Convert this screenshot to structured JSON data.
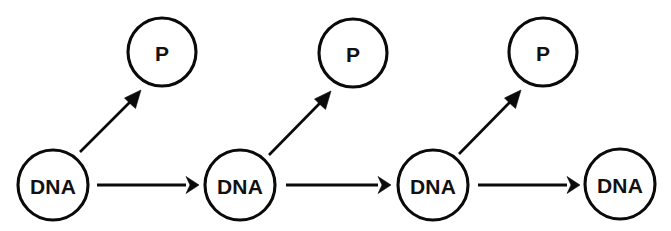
{
  "diagram": {
    "canvas": {
      "width": 671,
      "height": 231,
      "background": "#ffffff"
    },
    "stroke_color": "#0a0a0a",
    "fill_color": "#ffffff",
    "nodes": [
      {
        "id": "dna-1",
        "label": "DNA",
        "kind": "dna",
        "cx": 53,
        "cy": 185,
        "r": 35
      },
      {
        "id": "dna-2",
        "label": "DNA",
        "kind": "dna",
        "cx": 240,
        "cy": 185,
        "r": 35
      },
      {
        "id": "dna-3",
        "label": "DNA",
        "kind": "dna",
        "cx": 433,
        "cy": 185,
        "r": 35
      },
      {
        "id": "dna-4",
        "label": "DNA",
        "kind": "dna",
        "cx": 620,
        "cy": 184,
        "r": 35
      },
      {
        "id": "p-1",
        "label": "P",
        "kind": "protein",
        "cx": 162,
        "cy": 52,
        "r": 34
      },
      {
        "id": "p-2",
        "label": "P",
        "kind": "protein",
        "cx": 353,
        "cy": 53,
        "r": 34
      },
      {
        "id": "p-3",
        "label": "P",
        "kind": "protein",
        "cx": 543,
        "cy": 52,
        "r": 34
      }
    ],
    "edges": [
      {
        "id": "edge-dna1-dna2",
        "from": "dna-1",
        "to": "dna-2",
        "kind": "horizontal",
        "x1": 97,
        "y1": 185,
        "x2": 197,
        "y2": 185
      },
      {
        "id": "edge-dna2-dna3",
        "from": "dna-2",
        "to": "dna-3",
        "kind": "horizontal",
        "x1": 286,
        "y1": 185,
        "x2": 389,
        "y2": 185
      },
      {
        "id": "edge-dna3-dna4",
        "from": "dna-3",
        "to": "dna-4",
        "kind": "horizontal",
        "x1": 478,
        "y1": 185,
        "x2": 578,
        "y2": 185
      },
      {
        "id": "edge-dna1-p1",
        "from": "dna-1",
        "to": "p-1",
        "kind": "diagonal",
        "x1": 80,
        "y1": 152,
        "x2": 139,
        "y2": 93
      },
      {
        "id": "edge-dna2-p2",
        "from": "dna-2",
        "to": "p-2",
        "kind": "diagonal",
        "x1": 269,
        "y1": 155,
        "x2": 329,
        "y2": 94
      },
      {
        "id": "edge-dna3-p3",
        "from": "dna-3",
        "to": "p-3",
        "kind": "diagonal",
        "x1": 459,
        "y1": 154,
        "x2": 519,
        "y2": 93
      }
    ]
  }
}
